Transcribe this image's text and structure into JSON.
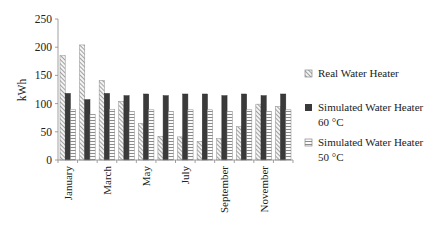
{
  "chart_data": {
    "type": "bar",
    "title": "",
    "xlabel": "",
    "ylabel": "kWh",
    "ylim": [
      0,
      250
    ],
    "yticks": [
      0,
      50,
      100,
      150,
      200,
      250
    ],
    "grid": false,
    "legend_position": "right",
    "categories": [
      "January",
      "February",
      "March",
      "April",
      "May",
      "June",
      "July",
      "August",
      "September",
      "October",
      "November",
      "December"
    ],
    "visible_tick_labels": [
      "January",
      "March",
      "May",
      "July",
      "September",
      "November"
    ],
    "series": [
      {
        "name": "Real Water Heater",
        "pattern": "diagonal-hatch",
        "color": "#9a9a9a",
        "values": [
          185,
          204,
          141,
          104,
          65,
          42,
          41,
          33,
          38,
          59,
          99,
          95
        ]
      },
      {
        "name": "Simulated Water Heater 60 °C",
        "pattern": "solid",
        "color": "#3a3a3a",
        "values": [
          118,
          107,
          118,
          114,
          117,
          114,
          117,
          117,
          114,
          117,
          114,
          117
        ]
      },
      {
        "name": "Simulated Water Heater 50 °C",
        "pattern": "horizontal-lines",
        "color": "#8a8a8a",
        "values": [
          90,
          81,
          90,
          86,
          89,
          86,
          89,
          89,
          86,
          89,
          86,
          89
        ]
      }
    ]
  },
  "legend": {
    "items": [
      {
        "line1": "Real Water Heater",
        "line2": ""
      },
      {
        "line1": "Simulated Water Heater",
        "line2": "60 °C"
      },
      {
        "line1": "Simulated Water Heater",
        "line2": "50 °C"
      }
    ]
  }
}
